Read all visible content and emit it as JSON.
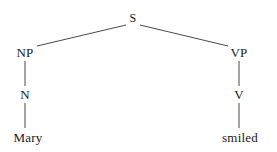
{
  "diagram": {
    "type": "syntax-tree",
    "sentence": "Mary smiled",
    "background_color": "#ffffff",
    "line_color": "#4a4a4a",
    "text_color": "#1a1a1a",
    "nodes": [
      {
        "id": "s",
        "label": "S",
        "x": 133,
        "y": 18,
        "level": "root"
      },
      {
        "id": "np",
        "label": "NP",
        "x": 25,
        "y": 52,
        "level": "phrase"
      },
      {
        "id": "vp",
        "label": "VP",
        "x": 239,
        "y": 52,
        "level": "phrase"
      },
      {
        "id": "n",
        "label": "N",
        "x": 25,
        "y": 94,
        "level": "pos"
      },
      {
        "id": "v",
        "label": "V",
        "x": 239,
        "y": 94,
        "level": "pos"
      },
      {
        "id": "mary",
        "label": "Mary",
        "x": 28,
        "y": 137,
        "level": "leaf"
      },
      {
        "id": "smiled",
        "label": "smiled",
        "x": 240,
        "y": 137,
        "level": "leaf"
      }
    ],
    "edges": [
      {
        "id": "s-np",
        "from": "s",
        "to": "np",
        "x1": 126,
        "y1": 25,
        "x2": 37,
        "y2": 46,
        "kind": "diagonal"
      },
      {
        "id": "s-vp",
        "from": "s",
        "to": "vp",
        "x1": 140,
        "y1": 25,
        "x2": 228,
        "y2": 46,
        "kind": "diagonal"
      },
      {
        "id": "np-n",
        "from": "np",
        "to": "n",
        "x1": 25,
        "y1": 61,
        "x2": 25,
        "y2": 86,
        "kind": "vertical"
      },
      {
        "id": "vp-v",
        "from": "vp",
        "to": "v",
        "x1": 239,
        "y1": 61,
        "x2": 239,
        "y2": 86,
        "kind": "vertical"
      },
      {
        "id": "n-mary",
        "from": "n",
        "to": "mary",
        "x1": 25,
        "y1": 103,
        "x2": 25,
        "y2": 128,
        "kind": "vertical"
      },
      {
        "id": "v-smiled",
        "from": "v",
        "to": "smiled",
        "x1": 239,
        "y1": 103,
        "x2": 239,
        "y2": 128,
        "kind": "vertical"
      }
    ]
  }
}
